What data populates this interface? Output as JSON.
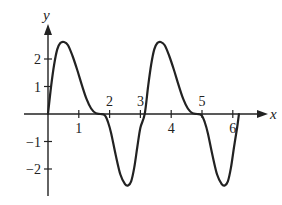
{
  "chart_data": {
    "type": "line",
    "title": "",
    "xlabel": "x",
    "ylabel": "y",
    "xlim": [
      0,
      6.8
    ],
    "ylim": [
      -3,
      3
    ],
    "grid": false,
    "legend": null,
    "x_ticks": [
      1,
      2,
      3,
      4,
      5,
      6
    ],
    "x_tick_labels": [
      "1",
      "2",
      "3",
      "4",
      "5",
      "6"
    ],
    "y_ticks": [
      -2,
      -1,
      1,
      2
    ],
    "y_tick_labels": [
      "−2",
      "−1",
      "1",
      "2"
    ],
    "series": [
      {
        "name": "f(x)",
        "x": [
          0.0,
          0.1,
          0.2,
          0.3,
          0.4,
          0.52,
          0.65,
          0.8,
          0.95,
          1.1,
          1.25,
          1.4,
          1.55,
          1.7,
          1.85,
          1.95,
          2.05,
          2.2,
          2.35,
          2.5,
          2.6,
          2.7,
          2.8,
          2.9,
          3.0,
          3.14,
          3.25,
          3.35,
          3.45,
          3.55,
          3.66,
          3.79,
          3.94,
          4.09,
          4.24,
          4.39,
          4.54,
          4.69,
          4.84,
          4.99,
          5.09,
          5.19,
          5.34,
          5.49,
          5.64,
          5.74,
          5.84,
          5.94,
          6.04,
          6.14,
          6.2
        ],
        "y": [
          0.0,
          1.0,
          1.8,
          2.35,
          2.58,
          2.62,
          2.5,
          2.1,
          1.6,
          1.05,
          0.55,
          0.2,
          0.03,
          0.0,
          -0.05,
          -0.3,
          -0.7,
          -1.5,
          -2.2,
          -2.55,
          -2.6,
          -2.45,
          -1.95,
          -1.2,
          -0.5,
          0.0,
          1.0,
          1.8,
          2.35,
          2.58,
          2.62,
          2.5,
          2.1,
          1.6,
          1.05,
          0.55,
          0.2,
          0.03,
          0.0,
          -0.05,
          -0.3,
          -0.7,
          -1.5,
          -2.2,
          -2.55,
          -2.6,
          -2.45,
          -1.95,
          -1.2,
          -0.5,
          0.0
        ]
      }
    ],
    "line_color": "#222222"
  }
}
